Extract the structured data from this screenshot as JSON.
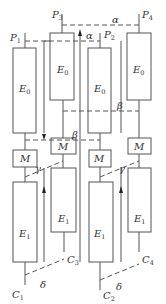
{
  "diagram": {
    "type": "lattice-cell-schematic",
    "labels": {
      "P1": {
        "main": "P",
        "sub": "1"
      },
      "P2": {
        "main": "P",
        "sub": "2"
      },
      "P3": {
        "main": "P",
        "sub": "3"
      },
      "P4": {
        "main": "P",
        "sub": "4"
      },
      "C1": {
        "main": "C",
        "sub": "1"
      },
      "C2": {
        "main": "C",
        "sub": "2"
      },
      "C3": {
        "main": "C",
        "sub": "3"
      },
      "C4": {
        "main": "C",
        "sub": "4"
      },
      "alpha": "α",
      "beta": "β",
      "gamma": "γ",
      "delta": "δ",
      "E0": {
        "main": "E",
        "sub": "0"
      },
      "E1": {
        "main": "E",
        "sub": "1"
      },
      "M": "M"
    },
    "columns": [
      {
        "id": "col-1",
        "top": "P1",
        "bottom": "C1",
        "blocks": [
          "E0",
          "M",
          "E1"
        ]
      },
      {
        "id": "col-3",
        "top": "P3",
        "bottom": "C3",
        "blocks": [
          "E0",
          "M",
          "E1"
        ]
      },
      {
        "id": "col-2",
        "top": "P2",
        "bottom": "C2",
        "blocks": [
          "E0",
          "M",
          "E1"
        ]
      },
      {
        "id": "col-4",
        "top": "P4",
        "bottom": "C4",
        "blocks": [
          "E0",
          "M",
          "E1"
        ]
      }
    ],
    "colors": {
      "stroke": "#555555",
      "text": "#333333",
      "background": "#ffffff"
    }
  }
}
